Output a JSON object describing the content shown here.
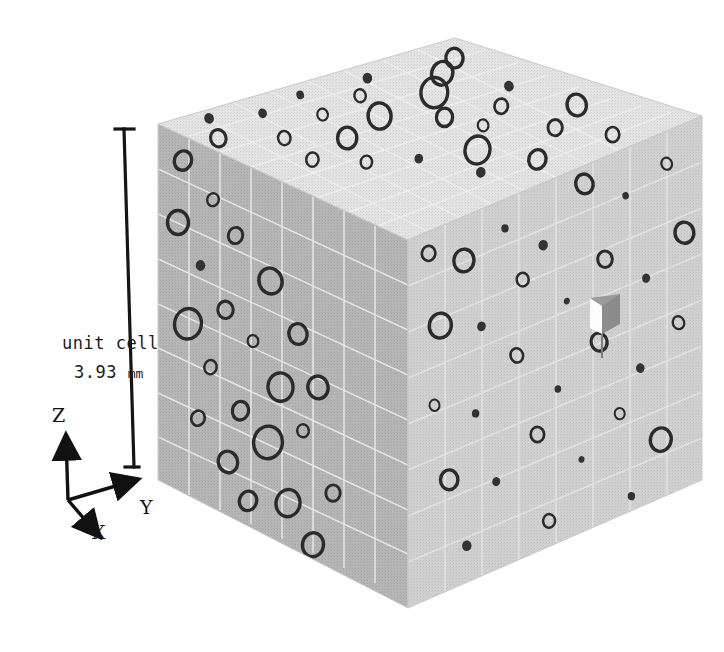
{
  "figure": {
    "type": "3d-rendering",
    "background_color": "#ffffff"
  },
  "annotations": {
    "scale_label_line1": "unit cell",
    "scale_label_value": "3.93",
    "scale_label_unit": "mm",
    "scale_bar": {
      "name": "unit-cell-scale-bar",
      "orientation": "vertical",
      "cap_style": "T-ends",
      "color": "#141414",
      "top_y": 128,
      "bottom_y": 465,
      "measures": "3.93 mm"
    }
  },
  "axes": {
    "origin_label": "",
    "items": [
      {
        "label": "Z",
        "direction": "up"
      },
      {
        "label": "Y",
        "direction": "right"
      },
      {
        "label": "X",
        "direction": "down-right"
      }
    ],
    "color": "#111111"
  },
  "cube": {
    "name": "unit-cell-cube",
    "faces": [
      {
        "name": "top-face",
        "fill": "#e2e2e2",
        "shading": "lightest"
      },
      {
        "name": "left-front-face",
        "fill": "#b4b4b4",
        "shading": "dark"
      },
      {
        "name": "right-front-face",
        "fill": "#cfcfcf",
        "shading": "medium"
      }
    ],
    "mesh": {
      "grid_visible": true,
      "grid_color": "#e8e8e8",
      "divisions": 8
    },
    "features": {
      "voids_description": "dark elliptical pores of varying radius distributed across all visible faces",
      "void_outline_color": "#2b2b2b",
      "notch": {
        "name": "surface-notch",
        "description": "small rectangular cut-out / missing voxel on right face",
        "highlight_color": "#ffffff",
        "shadow_color": "#8d8d8d"
      }
    }
  },
  "chart_data": {
    "type": "scatter",
    "title": "",
    "xlabel": "",
    "ylabel": "",
    "legend": [],
    "grid": true,
    "unit_cell_size_mm": 3.93,
    "series": [
      {
        "name": "top-face-pores",
        "face": "top",
        "points": [
          {
            "u": 0.06,
            "v": 0.17,
            "r": 0.016
          },
          {
            "u": 0.13,
            "v": 0.05,
            "r": 0.01
          },
          {
            "u": 0.19,
            "v": 0.28,
            "r": 0.013
          },
          {
            "u": 0.26,
            "v": 0.11,
            "r": 0.009
          },
          {
            "u": 0.31,
            "v": 0.39,
            "r": 0.02
          },
          {
            "u": 0.37,
            "v": 0.22,
            "r": 0.011
          },
          {
            "u": 0.42,
            "v": 0.07,
            "r": 0.008
          },
          {
            "u": 0.47,
            "v": 0.33,
            "r": 0.024
          },
          {
            "u": 0.53,
            "v": 0.18,
            "r": 0.012
          },
          {
            "u": 0.58,
            "v": 0.46,
            "r": 0.017
          },
          {
            "u": 0.63,
            "v": 0.09,
            "r": 0.01
          },
          {
            "u": 0.68,
            "v": 0.3,
            "r": 0.028
          },
          {
            "u": 0.73,
            "v": 0.51,
            "r": 0.014
          },
          {
            "u": 0.79,
            "v": 0.2,
            "r": 0.022
          },
          {
            "u": 0.84,
            "v": 0.41,
            "r": 0.01
          },
          {
            "u": 0.89,
            "v": 0.13,
            "r": 0.018
          },
          {
            "u": 0.24,
            "v": 0.55,
            "r": 0.012
          },
          {
            "u": 0.35,
            "v": 0.63,
            "r": 0.009
          },
          {
            "u": 0.49,
            "v": 0.7,
            "r": 0.026
          },
          {
            "u": 0.61,
            "v": 0.58,
            "r": 0.011
          },
          {
            "u": 0.72,
            "v": 0.74,
            "r": 0.015
          },
          {
            "u": 0.86,
            "v": 0.66,
            "r": 0.02
          },
          {
            "u": 0.15,
            "v": 0.44,
            "r": 0.013
          },
          {
            "u": 0.55,
            "v": 0.87,
            "r": 0.018
          },
          {
            "u": 0.4,
            "v": 0.82,
            "r": 0.01
          },
          {
            "u": 0.78,
            "v": 0.9,
            "r": 0.014
          }
        ]
      },
      {
        "name": "left-face-pores",
        "face": "left-front",
        "points": [
          {
            "u": 0.1,
            "v": 0.07,
            "r": 0.018
          },
          {
            "u": 0.22,
            "v": 0.14,
            "r": 0.012
          },
          {
            "u": 0.08,
            "v": 0.25,
            "r": 0.022
          },
          {
            "u": 0.31,
            "v": 0.21,
            "r": 0.015
          },
          {
            "u": 0.17,
            "v": 0.34,
            "r": 0.01
          },
          {
            "u": 0.45,
            "v": 0.29,
            "r": 0.024
          },
          {
            "u": 0.27,
            "v": 0.43,
            "r": 0.016
          },
          {
            "u": 0.12,
            "v": 0.52,
            "r": 0.028
          },
          {
            "u": 0.38,
            "v": 0.48,
            "r": 0.011
          },
          {
            "u": 0.56,
            "v": 0.4,
            "r": 0.019
          },
          {
            "u": 0.21,
            "v": 0.61,
            "r": 0.013
          },
          {
            "u": 0.49,
            "v": 0.57,
            "r": 0.026
          },
          {
            "u": 0.33,
            "v": 0.69,
            "r": 0.017
          },
          {
            "u": 0.64,
            "v": 0.52,
            "r": 0.021
          },
          {
            "u": 0.16,
            "v": 0.77,
            "r": 0.014
          },
          {
            "u": 0.44,
            "v": 0.74,
            "r": 0.03
          },
          {
            "u": 0.58,
            "v": 0.66,
            "r": 0.012
          },
          {
            "u": 0.28,
            "v": 0.85,
            "r": 0.02
          },
          {
            "u": 0.52,
            "v": 0.88,
            "r": 0.025
          },
          {
            "u": 0.7,
            "v": 0.79,
            "r": 0.015
          },
          {
            "u": 0.36,
            "v": 0.93,
            "r": 0.018
          },
          {
            "u": 0.62,
            "v": 0.96,
            "r": 0.022
          }
        ]
      },
      {
        "name": "right-face-pores",
        "face": "right-front",
        "points": [
          {
            "u": 0.07,
            "v": 0.06,
            "r": 0.02
          },
          {
            "u": 0.19,
            "v": 0.12,
            "r": 0.03
          },
          {
            "u": 0.33,
            "v": 0.08,
            "r": 0.011
          },
          {
            "u": 0.46,
            "v": 0.17,
            "r": 0.014
          },
          {
            "u": 0.6,
            "v": 0.05,
            "r": 0.026
          },
          {
            "u": 0.74,
            "v": 0.13,
            "r": 0.01
          },
          {
            "u": 0.88,
            "v": 0.09,
            "r": 0.016
          },
          {
            "u": 0.11,
            "v": 0.27,
            "r": 0.033
          },
          {
            "u": 0.25,
            "v": 0.32,
            "r": 0.013
          },
          {
            "u": 0.39,
            "v": 0.24,
            "r": 0.018
          },
          {
            "u": 0.54,
            "v": 0.35,
            "r": 0.009
          },
          {
            "u": 0.67,
            "v": 0.28,
            "r": 0.022
          },
          {
            "u": 0.81,
            "v": 0.38,
            "r": 0.012
          },
          {
            "u": 0.94,
            "v": 0.3,
            "r": 0.028
          },
          {
            "u": 0.09,
            "v": 0.48,
            "r": 0.015
          },
          {
            "u": 0.23,
            "v": 0.55,
            "r": 0.011
          },
          {
            "u": 0.37,
            "v": 0.44,
            "r": 0.019
          },
          {
            "u": 0.51,
            "v": 0.58,
            "r": 0.01
          },
          {
            "u": 0.65,
            "v": 0.5,
            "r": 0.024
          },
          {
            "u": 0.79,
            "v": 0.62,
            "r": 0.013
          },
          {
            "u": 0.92,
            "v": 0.54,
            "r": 0.017
          },
          {
            "u": 0.14,
            "v": 0.7,
            "r": 0.026
          },
          {
            "u": 0.3,
            "v": 0.76,
            "r": 0.012
          },
          {
            "u": 0.44,
            "v": 0.68,
            "r": 0.02
          },
          {
            "u": 0.59,
            "v": 0.8,
            "r": 0.009
          },
          {
            "u": 0.72,
            "v": 0.72,
            "r": 0.015
          },
          {
            "u": 0.86,
            "v": 0.84,
            "r": 0.031
          },
          {
            "u": 0.2,
            "v": 0.9,
            "r": 0.014
          },
          {
            "u": 0.48,
            "v": 0.93,
            "r": 0.018
          },
          {
            "u": 0.76,
            "v": 0.96,
            "r": 0.011
          }
        ]
      }
    ]
  }
}
